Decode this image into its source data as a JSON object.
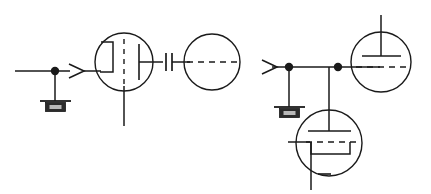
{
  "document": {
    "title": "Vacuum tube circuit schematic",
    "background_color": "#ffffff",
    "ink_color": "#1a1a1a",
    "width": 431,
    "height": 194
  },
  "legend": {
    "stage_left_label": "",
    "stage_right_label": ""
  },
  "components": {
    "left_stage": {
      "input_wire": {
        "name": "input-lead",
        "x1": 15,
        "y1": 71,
        "x2": 56,
        "y2": 71
      },
      "junction_dot": {
        "name": "input-junction",
        "cx": 55,
        "cy": 71,
        "r": 4
      },
      "ground_stub": {
        "x": 55,
        "y1": 71,
        "y2": 100
      },
      "ground_symbol": {
        "name": "ground-left",
        "bar_y": 100,
        "bar_x1": 40,
        "bar_x2": 71,
        "box_x": 46,
        "box_y": 102,
        "box_w": 20,
        "box_h": 9
      },
      "arrow": {
        "name": "signal-arrow-left",
        "tip_x": 84,
        "tail_x": 70,
        "y": 71,
        "spread": 7
      },
      "arrow_wire": {
        "x1": 84,
        "y1": 71,
        "x2": 100,
        "y2": 71
      },
      "tube": {
        "name": "triode-left",
        "envelope": {
          "cx": 124,
          "cy": 62,
          "r": 29
        },
        "cathode_bracket": {
          "x_left": 100,
          "x_right": 113,
          "y_top": 42,
          "y_bottom": 72
        },
        "grid_dashed": {
          "x": 124,
          "y1": 40,
          "y2": 86
        },
        "plate": {
          "x": 138,
          "y1": 44,
          "y2": 80
        },
        "plate_lead": {
          "x1": 138,
          "y1": 62,
          "x2": 162,
          "y2": 62
        },
        "cathode_down_lead": {
          "x": 124,
          "y1": 86,
          "y2": 125
        }
      }
    },
    "coupling_capacitor": {
      "name": "coupling-capacitor",
      "plate_a_x": 166,
      "plate_b_x": 172,
      "y_center": 62,
      "plate_half_height": 9,
      "lead_in_x1": 152,
      "lead_out_x2": 190
    },
    "right_circle": {
      "name": "unlabeled-circle-element",
      "cx": 212,
      "cy": 62,
      "r": 28,
      "dashed_line": {
        "x1": 186,
        "y1": 62,
        "x2": 238,
        "y2": 62
      }
    },
    "right_stage": {
      "arrow": {
        "name": "signal-arrow-right",
        "tip_x": 276,
        "tail_x": 262,
        "y": 67,
        "spread": 7
      },
      "bus_wire": {
        "x1": 276,
        "y1": 67,
        "x2": 380,
        "y2": 67
      },
      "junction_left": {
        "name": "bus-junction-left",
        "cx": 289,
        "cy": 67,
        "r": 4
      },
      "junction_right": {
        "name": "bus-junction-right",
        "cx": 338,
        "cy": 67,
        "r": 4
      },
      "ground_stub": {
        "x": 289,
        "y1": 67,
        "y2": 106
      },
      "ground_symbol": {
        "name": "ground-right",
        "bar_y": 106,
        "bar_x1": 274,
        "bar_x2": 305,
        "box_x": 280,
        "box_y": 108,
        "box_w": 20,
        "box_h": 9
      },
      "upper_tube": {
        "name": "tube-upper-right",
        "envelope": {
          "cx": 381,
          "cy": 62,
          "r": 30
        },
        "plate_lead_top": {
          "x": 381,
          "y1": 15,
          "y2": 55
        },
        "plate_bar": {
          "x1": 362,
          "y1": 55,
          "x2": 401,
          "y2": 55
        },
        "grid_dashed": {
          "x1": 355,
          "y1": 67,
          "x2": 408,
          "y2": 67
        },
        "grid_lead": {
          "x1": 338,
          "y1": 67,
          "x2": 360,
          "y2": 67
        }
      },
      "lower_tube": {
        "name": "tube-lower-right",
        "envelope": {
          "cx": 329,
          "cy": 143,
          "r": 33
        },
        "plate_lead_top": {
          "x": 329,
          "y1": 67,
          "y2": 130
        },
        "plate_bar": {
          "x1": 308,
          "y1": 130,
          "x2": 350,
          "y2": 130
        },
        "grid_dashed": {
          "x1": 305,
          "y1": 142,
          "x2": 355,
          "y2": 142
        },
        "grid_lead": {
          "x1": 288,
          "y1": 142,
          "x2": 310,
          "y2": 142
        },
        "cathode_bracket": {
          "x_left": 311,
          "x_right": 350,
          "y_top": 154,
          "y_bottom": 176
        },
        "cathode_down_lead": {
          "x": 311,
          "y1": 154,
          "y2": 190
        },
        "cathode_tick": {
          "x1": 318,
          "y1": 174,
          "x2": 330,
          "y2": 174
        }
      }
    }
  }
}
